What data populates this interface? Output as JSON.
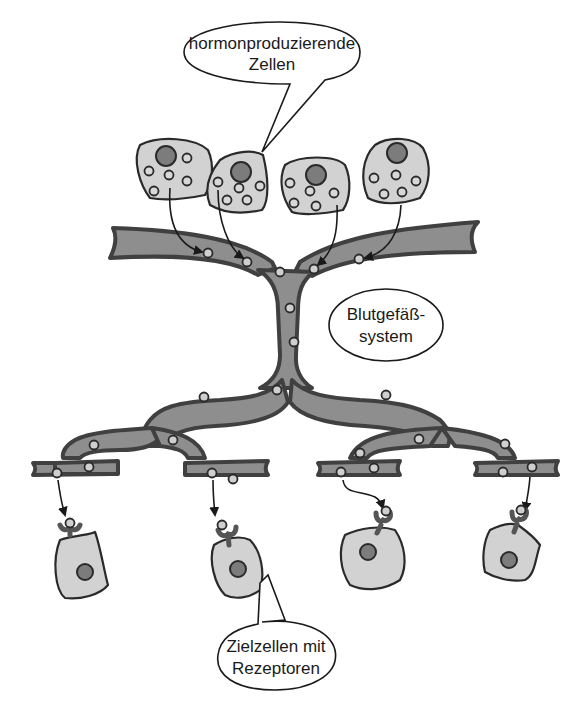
{
  "labels": {
    "producing_cells": {
      "line1": "hormonproduzierende",
      "line2": "Zellen"
    },
    "blood_vessel": {
      "line1": "Blutgefäß-",
      "line2": "system"
    },
    "target_cells": {
      "line1": "Zielzellen mit",
      "line2": "Rezeptoren"
    }
  },
  "colors": {
    "vessel_fill": "#8e8e8e",
    "vessel_wall": "#404040",
    "cell_fill": "#d2d2d2",
    "nucleus_fill": "#7c7c7c",
    "background": "#ffffff"
  },
  "counts": {
    "hormone_producing_cells": 4,
    "target_cells": 4
  }
}
